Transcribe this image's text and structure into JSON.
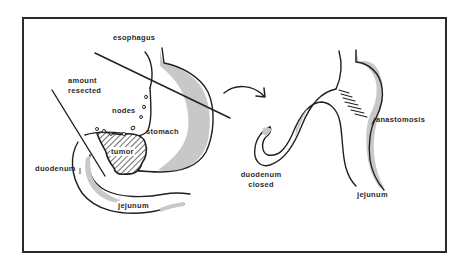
{
  "figure": {
    "type": "surgical-diagram",
    "colors": {
      "frame": "#2b2b2b",
      "outline": "#1f1f1f",
      "mucosa_shade": "#c8c8c8",
      "background": "#ffffff"
    }
  },
  "before": {
    "labels": {
      "esophagus": "esophagus",
      "amount_resected_line1": "amount",
      "amount_resected_line2": "resected",
      "nodes": "nodes",
      "stomach": "stomach",
      "tumor": "tumor",
      "duodenum": "duodenum",
      "jejunum": "jejunum"
    }
  },
  "transition": {
    "arrow_icon": "curved-arrow-right"
  },
  "after": {
    "labels": {
      "anastomosis": "anastomosis",
      "duodenum_closed_line1": "duodenum",
      "duodenum_closed_line2": "closed",
      "jejunum": "jejunum"
    }
  }
}
